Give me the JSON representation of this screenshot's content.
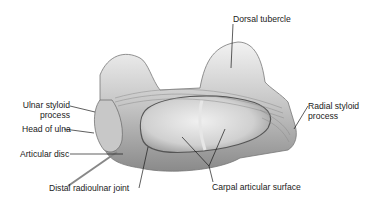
{
  "figure": {
    "labels": {
      "dorsal_tubercle": "Dorsal tubercle",
      "ulnar_styloid_line1": "Ulnar styloid",
      "ulnar_styloid_line2": "process",
      "head_of_ulna": "Head of ulna",
      "articular_disc": "Articular disc",
      "distal_radioulnar_joint": "Distal radioulnar joint",
      "radial_styloid_line1": "Radial styloid",
      "radial_styloid_line2": "process",
      "carpal_articular_surface": "Carpal articular surface"
    },
    "colors": {
      "background": "#ffffff",
      "bone_light": "#e6e6e6",
      "bone_mid": "#b8b8b8",
      "bone_dark": "#6e6e6e",
      "leader_line": "#1a1a1a"
    }
  }
}
